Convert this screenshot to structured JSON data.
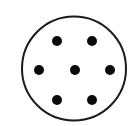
{
  "figure": {
    "background_color": "#ffffff",
    "circle": {
      "cx": 74,
      "cy": 68.5,
      "r": 52,
      "stroke_color": "#1a1a1a",
      "stroke_width": 2,
      "fill": "#ffffff"
    },
    "dot_color": "#0a0a0a",
    "dot_radius": 5,
    "dots": [
      {
        "cx": 57,
        "cy": 41
      },
      {
        "cx": 92,
        "cy": 41
      },
      {
        "cx": 39,
        "cy": 70
      },
      {
        "cx": 75,
        "cy": 70
      },
      {
        "cx": 110,
        "cy": 70
      },
      {
        "cx": 57,
        "cy": 100
      },
      {
        "cx": 92,
        "cy": 100
      }
    ]
  }
}
